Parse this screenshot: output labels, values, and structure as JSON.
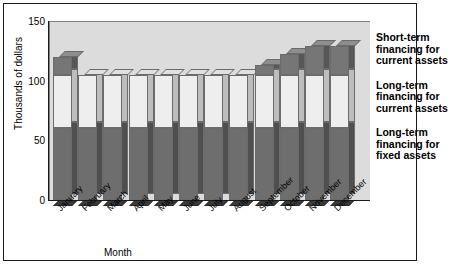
{
  "chart_data": {
    "type": "bar",
    "stacked": true,
    "title": "",
    "xlabel": "Month",
    "ylabel": "Thousands of dollars",
    "ylim": [
      0,
      150
    ],
    "yticks": [
      0,
      50,
      100,
      150
    ],
    "grid": false,
    "legend_position": "right",
    "categories": [
      "January",
      "February",
      "March",
      "April",
      "May",
      "June",
      "July",
      "August",
      "September",
      "October",
      "November",
      "December"
    ],
    "series": [
      {
        "name": "Long-term financing for fixed assets",
        "values": [
          60,
          60,
          60,
          60,
          60,
          60,
          60,
          60,
          60,
          60,
          60,
          60
        ]
      },
      {
        "name": "Long-term financing for current assets",
        "values": [
          45,
          45,
          45,
          45,
          45,
          45,
          45,
          45,
          45,
          45,
          45,
          45
        ]
      },
      {
        "name": "Short-term financing for current assets",
        "values": [
          15,
          0,
          0,
          0,
          0,
          0,
          0,
          0,
          8,
          17,
          24,
          24
        ]
      }
    ],
    "totals": [
      120,
      105,
      105,
      105,
      105,
      105,
      105,
      105,
      113,
      122,
      129,
      129
    ]
  },
  "axis": {
    "y_title": "Thousands of dollars",
    "x_title": "Month",
    "y_tick_labels": [
      "150",
      "100",
      "50",
      "0"
    ],
    "x_tick_labels": [
      "January",
      "February",
      "March",
      "April",
      "May",
      "June",
      "July",
      "August",
      "September",
      "October",
      "November",
      "December"
    ]
  },
  "legend": {
    "items": [
      {
        "label": "Short-term\nfinancing for\ncurrent assets",
        "line1": "Short-term",
        "line2": "financing for",
        "line3": "current assets"
      },
      {
        "label": "Long-term\nfinancing for\ncurrent assets",
        "line1": "Long-term",
        "line2": "financing for",
        "line3": "current assets"
      },
      {
        "label": "Long-term\nfinancing for\nfixed assets",
        "line1": "Long-term",
        "line2": "financing for",
        "line3": "fixed assets"
      }
    ]
  },
  "colors": {
    "plot_background": "#dcdcdc",
    "fixed_assets": "#6e6e6e",
    "current_long": "#eeeeee",
    "short_term": "#767676",
    "border": "#1a1a1a"
  }
}
